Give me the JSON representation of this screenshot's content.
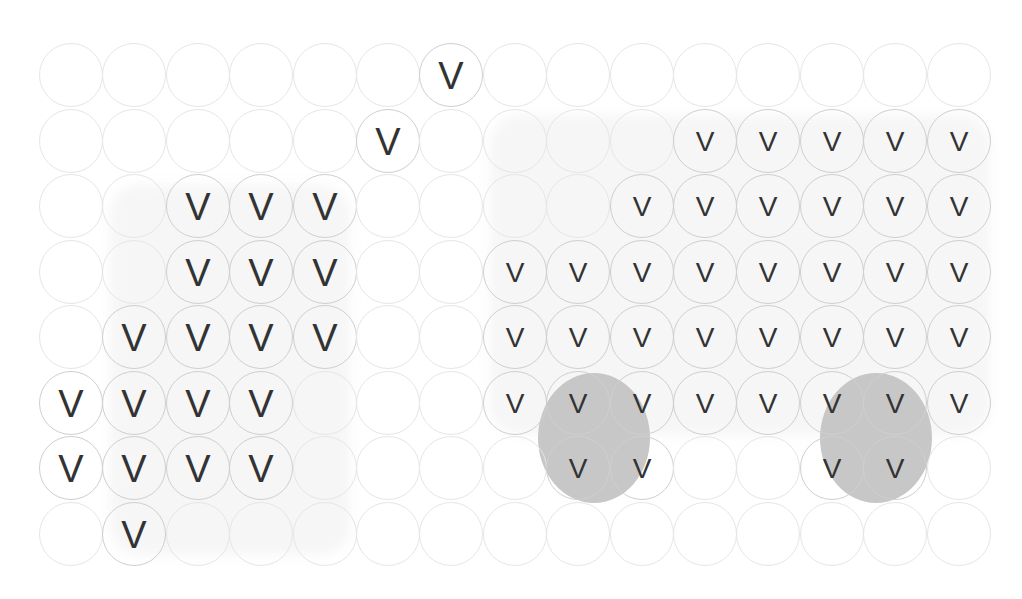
{
  "grid": {
    "columns": 15,
    "rows": 8,
    "origin_x": 39,
    "origin_y": 43,
    "pitch_x": 63.4,
    "pitch_y": 65.5,
    "cell_diameter": 64,
    "mark_symbol": "V"
  },
  "colors": {
    "background": "#ffffff",
    "circle_border_empty": "#e6e6e6",
    "circle_border_filled": "#cfcfcf",
    "mark": "#333333",
    "highlight_blob": "#c4c4c4",
    "region_shade": "#f6f6f6"
  },
  "regions": [
    {
      "name": "left-cluster-shade",
      "x": 110,
      "y": 185,
      "w": 240,
      "h": 370
    },
    {
      "name": "right-block-shade",
      "x": 490,
      "y": 115,
      "w": 500,
      "h": 320
    }
  ],
  "highlights": [
    {
      "name": "highlight-ellipse-1",
      "cx": 594,
      "cy": 438,
      "rx": 56,
      "ry": 65
    },
    {
      "name": "highlight-ellipse-2",
      "cx": 876,
      "cy": 438,
      "rx": 56,
      "ry": 65
    }
  ],
  "marks": {
    "large": [
      [
        1,
        7
      ],
      [
        2,
        6
      ],
      [
        3,
        3
      ],
      [
        3,
        4
      ],
      [
        3,
        5
      ],
      [
        4,
        3
      ],
      [
        4,
        4
      ],
      [
        4,
        5
      ],
      [
        5,
        2
      ],
      [
        5,
        3
      ],
      [
        5,
        4
      ],
      [
        5,
        5
      ],
      [
        6,
        1
      ],
      [
        6,
        2
      ],
      [
        6,
        3
      ],
      [
        6,
        4
      ],
      [
        7,
        1
      ],
      [
        7,
        2
      ],
      [
        7,
        3
      ],
      [
        7,
        4
      ],
      [
        8,
        2
      ]
    ],
    "small": [
      [
        2,
        11
      ],
      [
        2,
        12
      ],
      [
        2,
        13
      ],
      [
        2,
        14
      ],
      [
        2,
        15
      ],
      [
        3,
        10
      ],
      [
        3,
        11
      ],
      [
        3,
        12
      ],
      [
        3,
        13
      ],
      [
        3,
        14
      ],
      [
        3,
        15
      ],
      [
        4,
        8
      ],
      [
        4,
        9
      ],
      [
        4,
        10
      ],
      [
        4,
        11
      ],
      [
        4,
        12
      ],
      [
        4,
        13
      ],
      [
        4,
        14
      ],
      [
        4,
        15
      ],
      [
        5,
        8
      ],
      [
        5,
        9
      ],
      [
        5,
        10
      ],
      [
        5,
        11
      ],
      [
        5,
        12
      ],
      [
        5,
        13
      ],
      [
        5,
        14
      ],
      [
        5,
        15
      ],
      [
        6,
        8
      ],
      [
        6,
        9
      ],
      [
        6,
        10
      ],
      [
        6,
        11
      ],
      [
        6,
        12
      ],
      [
        6,
        13
      ],
      [
        6,
        14
      ],
      [
        6,
        15
      ],
      [
        7,
        9
      ],
      [
        7,
        10
      ],
      [
        7,
        13
      ],
      [
        7,
        14
      ]
    ]
  }
}
